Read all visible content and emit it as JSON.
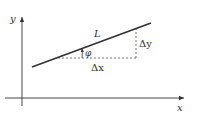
{
  "diagram": {
    "type": "geometry",
    "axes": {
      "x_label": "x",
      "y_label": "y"
    },
    "line": {
      "label": "L"
    },
    "angle": {
      "label": "φ"
    },
    "components": {
      "dx_label": "Δx",
      "dy_label": "Δy"
    },
    "colors": {
      "stroke": "#333333",
      "dashed": "#555555",
      "background": "#ffffff"
    }
  }
}
